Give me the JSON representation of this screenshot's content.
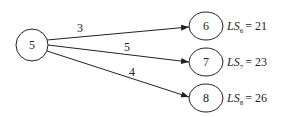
{
  "diagram": {
    "source": {
      "id": "5",
      "label": "5"
    },
    "targets": [
      {
        "id": "6",
        "label": "6",
        "weight": "3",
        "ls_name": "LS",
        "ls_sub": "6",
        "ls_value": "= 21"
      },
      {
        "id": "7",
        "label": "7",
        "weight": "5",
        "ls_name": "LS",
        "ls_sub": "7",
        "ls_value": "= 23"
      },
      {
        "id": "8",
        "label": "8",
        "weight": "4",
        "ls_name": "LS",
        "ls_sub": "8",
        "ls_value": "= 26"
      }
    ],
    "edges": [
      {
        "from": "5",
        "to": "6",
        "weight": "3"
      },
      {
        "from": "5",
        "to": "7",
        "weight": "5"
      },
      {
        "from": "5",
        "to": "8",
        "weight": "4"
      }
    ]
  }
}
